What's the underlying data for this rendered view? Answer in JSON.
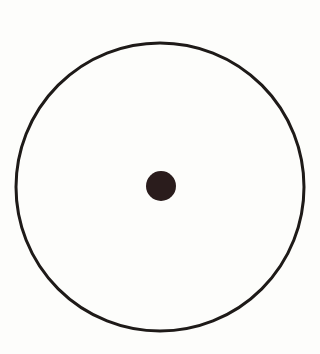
{
  "diagram": {
    "type": "circle-with-center-point",
    "background_color": "#fdfdfb",
    "outer_circle": {
      "cx": 160,
      "cy": 187,
      "r": 144,
      "stroke_color": "#1e1a18",
      "stroke_width": 3,
      "fill": "none"
    },
    "center_point": {
      "cx": 161,
      "cy": 186,
      "r": 15,
      "fill_color": "#2a1c1c"
    }
  }
}
